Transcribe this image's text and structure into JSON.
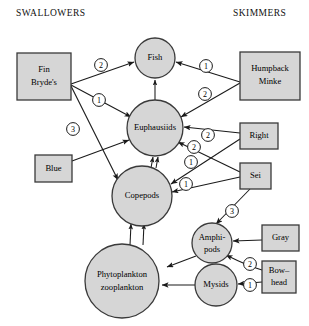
{
  "headers": {
    "left": "SWALLOWERS",
    "right": "SKIMMERS"
  },
  "style": {
    "node_fill": "#d6d6d6",
    "node_stroke": "#3a3a3a",
    "line_color": "#1a1a1a",
    "background": "#ffffff"
  },
  "nodes": {
    "fish": {
      "label": "Fish",
      "shape": "circle",
      "cx": 155,
      "cy": 58,
      "r": 20
    },
    "euphausiids": {
      "label": "Euphausiids",
      "shape": "circle",
      "cx": 155,
      "cy": 128,
      "r": 28
    },
    "copepods": {
      "label": "Copepods",
      "shape": "circle",
      "cx": 142,
      "cy": 196,
      "r": 30
    },
    "phyto": {
      "label_line1": "Phytoplankton",
      "label_line2": "zooplankton",
      "shape": "circle",
      "cx": 122,
      "cy": 281,
      "r": 37
    },
    "amphipods": {
      "label_line1": "Amphi-",
      "label_line2": "pods",
      "shape": "circle",
      "cx": 212,
      "cy": 243,
      "r": 20
    },
    "mysids": {
      "label": "Mysids",
      "shape": "circle",
      "cx": 216,
      "cy": 285,
      "r": 21
    },
    "fin_brydes": {
      "label_line1": "Fin",
      "label_line2": "Bryde's",
      "shape": "box",
      "x": 17,
      "y": 53,
      "w": 54,
      "h": 47
    },
    "blue": {
      "label": "Blue",
      "shape": "box",
      "x": 35,
      "y": 155,
      "w": 37,
      "h": 27
    },
    "humpback_minke": {
      "label_line1": "Humpback",
      "label_line2": "Minke",
      "shape": "box",
      "x": 240,
      "y": 52,
      "w": 60,
      "h": 48
    },
    "right": {
      "label": "Right",
      "shape": "box",
      "x": 240,
      "y": 123,
      "w": 38,
      "h": 26
    },
    "sei": {
      "label": "Sei",
      "shape": "box",
      "x": 240,
      "y": 163,
      "w": 31,
      "h": 26
    },
    "gray": {
      "label": "Gray",
      "shape": "box",
      "x": 262,
      "y": 225,
      "w": 37,
      "h": 26
    },
    "bowhead": {
      "label_line1": "Bow–",
      "label_line2": "head",
      "shape": "box",
      "x": 262,
      "y": 261,
      "w": 34,
      "h": 32
    }
  },
  "edges": [
    {
      "from": "fin_brydes",
      "to": "fish",
      "rank": "2",
      "lx": 101,
      "ly": 65
    },
    {
      "from": "fin_brydes",
      "to": "euphausiids",
      "rank": "1",
      "lx": 99,
      "ly": 100
    },
    {
      "from": "fin_brydes",
      "to": "copepods",
      "rank": "3",
      "lx": 73,
      "ly": 129
    },
    {
      "from": "blue",
      "to": "euphausiids",
      "rank": "",
      "lx": 0,
      "ly": 0
    },
    {
      "from": "humpback_minke",
      "to": "fish",
      "rank": "1",
      "lx": 206,
      "ly": 66
    },
    {
      "from": "humpback_minke",
      "to": "euphausiids",
      "rank": "2",
      "lx": 205,
      "ly": 94
    },
    {
      "from": "right",
      "to": "euphausiids",
      "rank": "2",
      "lx": 208,
      "ly": 135
    },
    {
      "from": "right",
      "to": "copepods",
      "rank": "1",
      "lx": 191,
      "ly": 162
    },
    {
      "from": "sei",
      "to": "euphausiids",
      "rank": "2",
      "lx": 194,
      "ly": 147
    },
    {
      "from": "sei",
      "to": "copepods",
      "rank": "1",
      "lx": 186,
      "ly": 184
    },
    {
      "from": "sei",
      "to": "amphipods",
      "rank": "3",
      "lx": 232,
      "ly": 211
    },
    {
      "from": "gray",
      "to": "amphipods",
      "rank": "",
      "lx": 0,
      "ly": 0
    },
    {
      "from": "bowhead",
      "to": "amphipods",
      "rank": "2",
      "lx": 250,
      "ly": 264
    },
    {
      "from": "bowhead",
      "to": "mysids",
      "rank": "1",
      "lx": 250,
      "ly": 285
    },
    {
      "from": "euphausiids",
      "to": "fish",
      "rank": "",
      "lx": 0,
      "ly": 0
    },
    {
      "from": "copepods",
      "to": "euphausiids",
      "rank": "",
      "lx": 0,
      "ly": 0
    },
    {
      "from": "phyto",
      "to": "copepods",
      "rank": "",
      "lx": 0,
      "ly": 0
    },
    {
      "from": "amphipods",
      "to": "phyto",
      "rank": "",
      "lx": 0,
      "ly": 0
    },
    {
      "from": "mysids",
      "to": "phyto",
      "rank": "",
      "lx": 0,
      "ly": 0
    }
  ]
}
